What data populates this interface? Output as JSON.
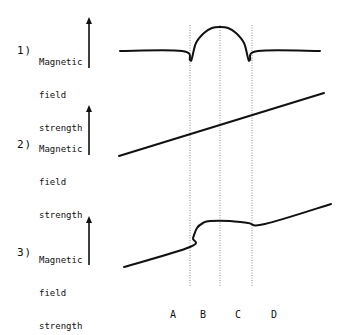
{
  "diagram": {
    "panels": [
      {
        "number": "1)",
        "ylabel_lines": [
          "Magnetic",
          "field",
          "strength"
        ],
        "curve": [
          [
            120,
            51
          ],
          [
            182,
            51
          ],
          [
            190,
            60
          ],
          [
            192,
            58
          ],
          [
            196,
            43
          ],
          [
            204,
            33
          ],
          [
            212,
            28
          ],
          [
            220,
            27
          ],
          [
            228,
            28
          ],
          [
            236,
            33
          ],
          [
            244,
            43
          ],
          [
            248,
            58
          ],
          [
            250,
            60
          ],
          [
            258,
            51
          ],
          [
            320,
            51
          ]
        ]
      },
      {
        "number": "2)",
        "ylabel_lines": [
          "Magnetic",
          "field",
          "strength"
        ],
        "curve": [
          [
            119,
            156
          ],
          [
            324,
            93
          ]
        ]
      },
      {
        "number": "3)",
        "ylabel_lines": [
          "Magnetic",
          "field",
          "strength"
        ],
        "curve": [
          [
            124,
            267
          ],
          [
            190,
            247
          ],
          [
            193,
            238
          ],
          [
            197,
            228
          ],
          [
            203,
            223
          ],
          [
            210,
            221
          ],
          [
            230,
            221
          ],
          [
            248,
            223
          ],
          [
            265,
            224
          ],
          [
            331,
            204
          ]
        ]
      }
    ],
    "region_labels": [
      "A",
      "B",
      "C",
      "D"
    ],
    "region_label_x": [
      173,
      203,
      238,
      274
    ],
    "dividers_x": [
      190,
      220,
      252
    ],
    "colors": {
      "curve": "#111111",
      "divider": "#8a8a8a",
      "text": "#111111"
    }
  }
}
